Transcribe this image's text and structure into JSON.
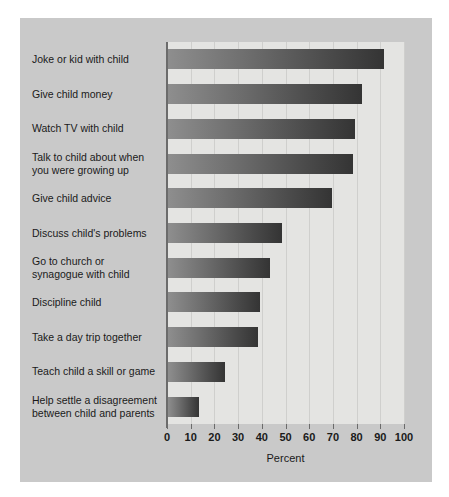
{
  "chart_data": {
    "type": "bar",
    "orientation": "horizontal",
    "title": "",
    "xlabel": "Percent",
    "ylabel": "",
    "xlim": [
      0,
      100
    ],
    "xticks": [
      0,
      10,
      20,
      30,
      40,
      50,
      60,
      70,
      80,
      90,
      100
    ],
    "xtick_labels": [
      "0",
      "10",
      "20",
      "30",
      "40",
      "50",
      "60",
      "70",
      "80",
      "90",
      "100"
    ],
    "grid": true,
    "legend": false,
    "categories": [
      "Joke or kid with child",
      "Give child money",
      "Watch TV with child",
      "Talk to child about when you were growing up",
      "Give child advice",
      "Discuss child's problems",
      "Go to church or synagogue with child",
      "Discipline child",
      "Take a day trip together",
      "Teach child a skill or game",
      "Help settle a disagreement between child and parents"
    ],
    "values": [
      91,
      82,
      79,
      78,
      69,
      48,
      43,
      39,
      38,
      24,
      13
    ],
    "bar_color_start": "#8e8e8e",
    "bar_color_end": "#343434",
    "plot_background": "#e4e4e2",
    "figure_background": "#c9c9c9"
  },
  "figure": {
    "rows": [
      {
        "label_line1": "Joke or kid with child",
        "label_line2": "",
        "value": 91
      },
      {
        "label_line1": "Give child money",
        "label_line2": "",
        "value": 82
      },
      {
        "label_line1": "Watch TV with child",
        "label_line2": "",
        "value": 79
      },
      {
        "label_line1": "Talk to child about when",
        "label_line2": "you were growing up",
        "value": 78
      },
      {
        "label_line1": "Give child advice",
        "label_line2": "",
        "value": 69
      },
      {
        "label_line1": "Discuss child's problems",
        "label_line2": "",
        "value": 48
      },
      {
        "label_line1": "Go to church or",
        "label_line2": "synagogue with child",
        "value": 43
      },
      {
        "label_line1": "Discipline child",
        "label_line2": "",
        "value": 39
      },
      {
        "label_line1": "Take a day trip together",
        "label_line2": "",
        "value": 38
      },
      {
        "label_line1": "Teach child a skill or game",
        "label_line2": "",
        "value": 24
      },
      {
        "label_line1": "Help settle a disagreement",
        "label_line2": "between child and parents",
        "value": 13
      }
    ],
    "axis_title": "Percent"
  }
}
